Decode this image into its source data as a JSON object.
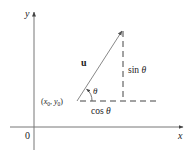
{
  "diagram": {
    "axes": {
      "x_label": "x",
      "y_label": "y",
      "origin_label": "0"
    },
    "vector": {
      "label": "u",
      "start_label_x": "x",
      "start_label_x_sub": "0",
      "start_label_sep": ", ",
      "start_label_y": "y",
      "start_label_y_sub": "0",
      "start_label_open": "(",
      "start_label_close": ")"
    },
    "angle_label": "θ",
    "sin_label": "sin",
    "sin_theta": "θ",
    "cos_label": "cos",
    "cos_theta": "θ",
    "colors": {
      "axis": "#555555",
      "vector": "#777777",
      "dashed": "#444444",
      "text": "#222222"
    }
  }
}
